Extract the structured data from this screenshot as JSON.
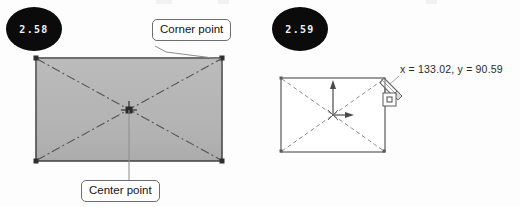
{
  "page": {
    "background_color": "#fdfdfd",
    "width": 520,
    "height": 207
  },
  "figures": [
    {
      "id": "figure-2-58",
      "badge_label": "2.58",
      "badge_color": "#0b0b0b",
      "badge_text_color": "#f2f2f2",
      "shape": {
        "kind": "rectangle",
        "fill": "#b4b4b4",
        "stroke": "#4b4b4b",
        "diagonals_style": "dash-dot",
        "diagonals_color": "#555555",
        "grip_color": "#3a3a3a"
      },
      "callouts": [
        {
          "name": "corner-point",
          "label": "Corner point",
          "border_color": "#6e6e6e",
          "text_color": "#131313"
        },
        {
          "name": "center-point",
          "label": "Center point",
          "border_color": "#6e6e6e",
          "text_color": "#131313"
        }
      ]
    },
    {
      "id": "figure-2-59",
      "badge_label": "2.59",
      "badge_color": "#0b0b0b",
      "badge_text_color": "#f2f2f2",
      "shape": {
        "kind": "rectangle",
        "fill": "#ffffff",
        "stroke": "#5a5a5a",
        "diagonals_style": "dashed",
        "diagonals_color": "#8d8d8d"
      },
      "coordinate_readout": {
        "text": "x = 133.02, y = 90.59",
        "x_label": "x",
        "x_value": "133.02",
        "y_label": "y",
        "y_value": "90.59",
        "text_color": "#2a2a2a"
      },
      "markers": [
        {
          "name": "ucs-axis-marker",
          "axes": [
            "up",
            "right"
          ],
          "color": "#4a4a4a"
        },
        {
          "name": "snap-endpoint-square",
          "color": "#4a4a4a"
        },
        {
          "name": "pencil-cursor",
          "color": "#6a6a6a"
        }
      ]
    }
  ]
}
